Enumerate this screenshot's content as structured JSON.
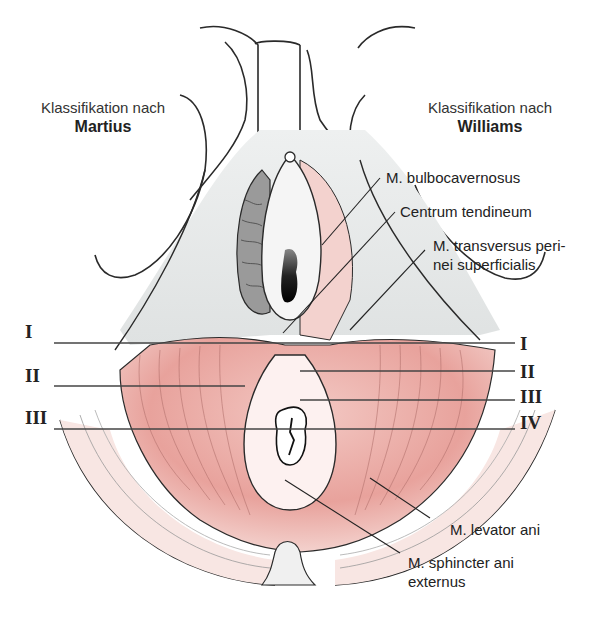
{
  "classification": {
    "left": {
      "prefix": "Klassifikation nach",
      "name": "Martius"
    },
    "right": {
      "prefix": "Klassifikation nach",
      "name": "Williams"
    }
  },
  "grades": {
    "martius": [
      "I",
      "II",
      "III"
    ],
    "williams": [
      "I",
      "II",
      "III",
      "IV"
    ]
  },
  "labels": {
    "bulbocavernosus": "M. bulbocavernosus",
    "centrum": "Centrum tendineum",
    "transversus_line1": "M. transversus peri-",
    "transversus_line2": "nei superficialis",
    "levator": "M. levator ani",
    "sphincter_line1": "M. sphincter ani",
    "sphincter_line2": "externus"
  },
  "colors": {
    "muscle": "#e9a6a2",
    "muscle_light": "#f6dcd8",
    "tissue_gray": "#e6e8e8",
    "outline": "#2a2a2a",
    "dark": "#1a1a1a"
  }
}
